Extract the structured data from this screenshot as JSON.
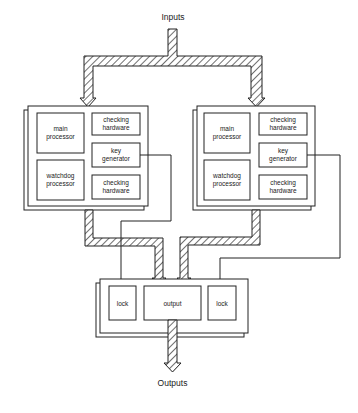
{
  "diagram": {
    "input_label": "Inputs",
    "output_label": "Outputs",
    "channels": [
      {
        "id": "left",
        "blocks": {
          "main_processor": [
            "main",
            "processor"
          ],
          "watchdog_processor": [
            "watchdog",
            "processor"
          ],
          "checking_hw_top": [
            "checking",
            "hardware"
          ],
          "key_generator": [
            "key",
            "generator"
          ],
          "checking_hw_bottom": [
            "checking",
            "hardware"
          ]
        }
      },
      {
        "id": "right",
        "blocks": {
          "main_processor": [
            "main",
            "processor"
          ],
          "watchdog_processor": [
            "watchdog",
            "processor"
          ],
          "checking_hw_top": [
            "checking",
            "hardware"
          ],
          "key_generator": [
            "key",
            "generator"
          ],
          "checking_hw_bottom": [
            "checking",
            "hardware"
          ]
        }
      }
    ],
    "output_stage": {
      "lock_left": "lock",
      "output": "output",
      "lock_right": "lock"
    },
    "colors": {
      "line": "#222222",
      "background": "#ffffff"
    }
  }
}
